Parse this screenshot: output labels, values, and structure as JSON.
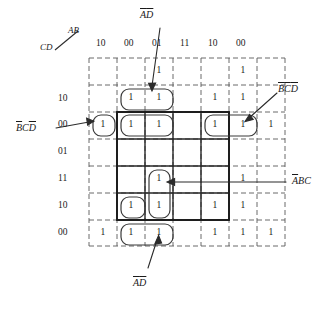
{
  "diagram": {
    "type": "karnaugh-map",
    "axis_label_rows": "CD",
    "axis_label_cols": "AB",
    "column_headers": [
      "10",
      "00",
      "01",
      "11",
      "10",
      "00"
    ],
    "row_headers": [
      "10",
      "00",
      "01",
      "11",
      "10",
      "00"
    ],
    "grid": {
      "cols": 7,
      "rows": 7,
      "core_col_start": 2,
      "core_col_end": 5,
      "core_row_start": 2,
      "core_row_end": 5
    },
    "ones": [
      {
        "r": 1,
        "c": 3
      },
      {
        "r": 1,
        "c": 6
      },
      {
        "r": 2,
        "c": 2
      },
      {
        "r": 2,
        "c": 3
      },
      {
        "r": 2,
        "c": 5
      },
      {
        "r": 2,
        "c": 6
      },
      {
        "r": 3,
        "c": 1
      },
      {
        "r": 3,
        "c": 2
      },
      {
        "r": 3,
        "c": 3
      },
      {
        "r": 3,
        "c": 5
      },
      {
        "r": 3,
        "c": 6
      },
      {
        "r": 3,
        "c": 7
      },
      {
        "r": 5,
        "c": 3
      },
      {
        "r": 5,
        "c": 6
      },
      {
        "r": 6,
        "c": 2
      },
      {
        "r": 6,
        "c": 3
      },
      {
        "r": 6,
        "c": 5
      },
      {
        "r": 6,
        "c": 6
      },
      {
        "r": 7,
        "c": 1
      },
      {
        "r": 7,
        "c": 2
      },
      {
        "r": 7,
        "c": 3
      },
      {
        "r": 7,
        "c": 5
      },
      {
        "r": 7,
        "c": 6
      },
      {
        "r": 7,
        "c": 7
      }
    ],
    "one_glyph": "1",
    "annotations": [
      {
        "id": "a-not-d-not-top",
        "text_parts": [
          "A",
          "D"
        ],
        "bars": [
          true,
          true
        ],
        "label": "ADbar-top"
      },
      {
        "id": "b-not-c-not-d-not",
        "text_parts": [
          "B",
          "C",
          "D"
        ],
        "bars": [
          true,
          true,
          true
        ],
        "label": "BCD-right"
      },
      {
        "id": "b-not-c-d-not",
        "text_parts": [
          "B",
          "C",
          "D"
        ],
        "bars": [
          true,
          false,
          true
        ],
        "label": "BCD-left"
      },
      {
        "id": "a-not-b-c",
        "text_parts": [
          "A",
          "B",
          "C"
        ],
        "bars": [
          true,
          false,
          false
        ],
        "label": "ABC-right"
      },
      {
        "id": "a-not-d-not-bottom",
        "text_parts": [
          "A",
          "D"
        ],
        "bars": [
          true,
          true
        ],
        "label": "ADbar-bottom"
      }
    ],
    "annotation_text": {
      "ad_top": "A D",
      "bcd_right": "B C D",
      "bcd_left": "B C D",
      "abc_right": "A B C",
      "ad_bottom": "A D"
    },
    "colors": {
      "ink": "#1a1a1a",
      "dashed": "#555555",
      "solid": "#222222",
      "background": "#ffffff"
    }
  }
}
